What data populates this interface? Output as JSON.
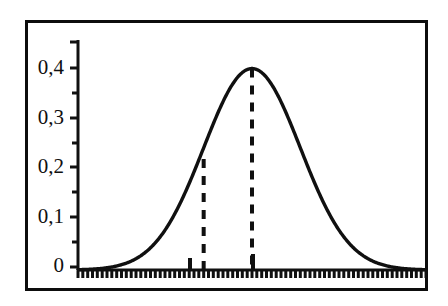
{
  "figure": {
    "name": "normal-distribution-curve",
    "background_color": "#ffffff",
    "line_color": "#101010",
    "frame_color": "#0d0d0d"
  },
  "axes": {
    "y_tick_labels": [
      "0,4",
      "0,3",
      "0,2",
      "0,1",
      "0"
    ],
    "y_tick_values": [
      0.4,
      0.3,
      0.2,
      0.1,
      0.0
    ],
    "y_minor_step": 0.05,
    "x_tick_labels": [],
    "x_minor_tick_count": 72
  },
  "annotations": {
    "mean_line_label": "mean-dashed-line",
    "sigma_line_label": "minus-one-sigma-dashed-line",
    "mean_value_at_peak": 0.4,
    "sigma_value": 0.22
  },
  "chart_data": {
    "type": "line",
    "title": "",
    "subtitle": "",
    "xlabel": "",
    "ylabel": "",
    "xlim": [
      -3.6,
      3.6
    ],
    "ylim": [
      0,
      0.45
    ],
    "grid": false,
    "legend": null,
    "y_ticks": [
      0,
      0.1,
      0.2,
      0.3,
      0.4
    ],
    "y_tick_labels": [
      "0",
      "0,1",
      "0,2",
      "0,3",
      "0,4"
    ],
    "y_minor_ticks": [
      0.05,
      0.15,
      0.25,
      0.35,
      0.45
    ],
    "x_ticks": [],
    "series": [
      {
        "name": "standard normal density",
        "x": [
          -3.6,
          -3.4,
          -3.2,
          -3.0,
          -2.8,
          -2.6,
          -2.4,
          -2.2,
          -2.0,
          -1.8,
          -1.6,
          -1.4,
          -1.2,
          -1.0,
          -0.8,
          -0.6,
          -0.4,
          -0.2,
          0.0,
          0.2,
          0.4,
          0.6,
          0.8,
          1.0,
          1.2,
          1.4,
          1.6,
          1.8,
          2.0,
          2.2,
          2.4,
          2.6,
          2.8,
          3.0,
          3.2,
          3.4,
          3.6
        ],
        "y": [
          0.001,
          0.001,
          0.002,
          0.004,
          0.008,
          0.014,
          0.022,
          0.035,
          0.054,
          0.079,
          0.111,
          0.15,
          0.194,
          0.242,
          0.29,
          0.333,
          0.368,
          0.391,
          0.399,
          0.391,
          0.368,
          0.333,
          0.29,
          0.242,
          0.194,
          0.15,
          0.111,
          0.079,
          0.054,
          0.035,
          0.022,
          0.014,
          0.008,
          0.004,
          0.002,
          0.001,
          0.001
        ]
      }
    ],
    "annotations": [
      {
        "type": "vline",
        "name": "mean-dashed-line",
        "x": 0.0,
        "y_top": 0.399,
        "style": "dashed"
      },
      {
        "type": "vline",
        "name": "minus-one-sigma-dashed-line",
        "x": -1.0,
        "y_top": 0.22,
        "style": "dashed"
      }
    ]
  }
}
